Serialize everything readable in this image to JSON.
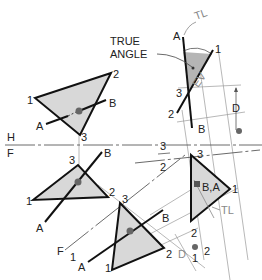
{
  "diagram": {
    "title_label": "TRUE ANGLE",
    "title_line1": "TRUE",
    "title_line2": "ANGLE",
    "colors": {
      "plane_fill": "#d8d8d8",
      "true_angle_fill": "#b5b5b5",
      "line": "#111111",
      "construction": "#999999"
    },
    "top_view": {
      "vertices": [
        "1",
        "2",
        "3"
      ],
      "line_ends": [
        "A",
        "B"
      ]
    },
    "fold_hf": {
      "upper": "H",
      "lower": "F"
    },
    "front_view": {
      "vertices": [
        "3",
        "2",
        "1"
      ],
      "line_ends": [
        "B",
        "A"
      ]
    },
    "fold_f1": {
      "upper": "F",
      "lower": "1"
    },
    "aux1_view": {
      "vertices": [
        "3",
        "1",
        "2"
      ],
      "line_ends": [
        "A",
        "B"
      ],
      "dim": "D"
    },
    "fold_32": {
      "upper": "3",
      "lower": "2"
    },
    "aux2_view": {
      "vertices": [
        "3",
        "1",
        "2"
      ],
      "point_label": "B,A",
      "tl_label": "TL",
      "dim_point": "2"
    },
    "aux3_view": {
      "vertices": [
        "1",
        "3",
        "2"
      ],
      "line_ends": [
        "A",
        "B"
      ],
      "tl_label": "TL",
      "ev_label": "EV",
      "dim": "D"
    },
    "extra_labels": {
      "one": "1",
      "two": "2"
    }
  }
}
